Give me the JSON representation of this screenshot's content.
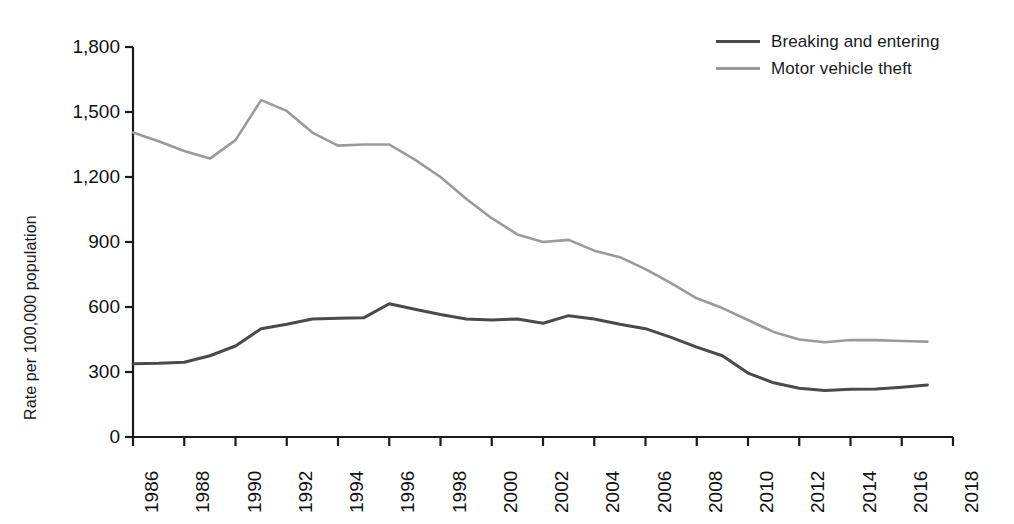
{
  "chart_data": {
    "type": "line",
    "title": "",
    "subtitle": "",
    "xlabel": "",
    "ylabel": "Rate per 100,000 population",
    "xlim": [
      1986,
      2018
    ],
    "ylim": [
      0,
      1800
    ],
    "grid": false,
    "legend_position": "top-right",
    "x": [
      1986,
      1987,
      1988,
      1989,
      1990,
      1991,
      1992,
      1993,
      1994,
      1995,
      1996,
      1997,
      1998,
      1999,
      2000,
      2001,
      2002,
      2003,
      2004,
      2005,
      2006,
      2007,
      2008,
      2009,
      2010,
      2011,
      2012,
      2013,
      2014,
      2015,
      2016,
      2017
    ],
    "xtick_labels": [
      "1986",
      "1988",
      "1990",
      "1992",
      "1994",
      "1996",
      "1998",
      "2000",
      "2002",
      "2004",
      "2006",
      "2008",
      "2010",
      "2012",
      "2014",
      "2016",
      "2018"
    ],
    "xtick_values": [
      1986,
      1988,
      1990,
      1992,
      1994,
      1996,
      1998,
      2000,
      2002,
      2004,
      2006,
      2008,
      2010,
      2012,
      2014,
      2016,
      2018
    ],
    "ytick_labels": [
      "0",
      "300",
      "600",
      "900",
      "1,200",
      "1,500",
      "1,800"
    ],
    "ytick_values": [
      0,
      300,
      600,
      900,
      1200,
      1500,
      1800
    ],
    "series": [
      {
        "name": "Breaking and entering",
        "color": "#4a4a4a",
        "values": [
          338,
          340,
          345,
          375,
          420,
          500,
          520,
          545,
          548,
          550,
          615,
          590,
          565,
          545,
          540,
          545,
          525,
          560,
          545,
          520,
          500,
          460,
          415,
          375,
          295,
          250,
          225,
          215,
          220,
          222,
          230,
          240
        ]
      },
      {
        "name": "Motor vehicle theft",
        "color": "#9a9a9a",
        "values": [
          1405,
          1365,
          1320,
          1285,
          1370,
          1555,
          1505,
          1405,
          1345,
          1350,
          1350,
          1280,
          1200,
          1100,
          1010,
          935,
          900,
          910,
          860,
          830,
          775,
          710,
          640,
          595,
          540,
          485,
          450,
          437,
          448,
          447,
          443,
          440
        ]
      }
    ]
  }
}
